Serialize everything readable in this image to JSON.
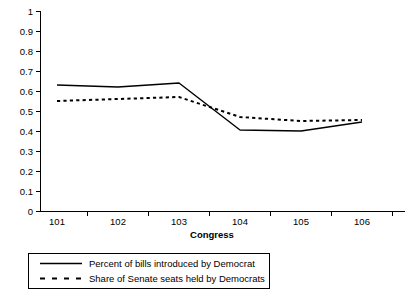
{
  "chart_data": {
    "type": "line",
    "title": "",
    "xlabel": "Congress",
    "ylabel": "",
    "categories": [
      "101",
      "102",
      "103",
      "104",
      "105",
      "106"
    ],
    "series": [
      {
        "name": "Percent of bills introduced by Democrat",
        "style": "solid",
        "values": [
          0.63,
          0.62,
          0.64,
          0.405,
          0.4,
          0.445
        ]
      },
      {
        "name": "Share of Senate seats held by Democrats",
        "style": "dashed",
        "values": [
          0.55,
          0.56,
          0.57,
          0.47,
          0.45,
          0.455
        ]
      }
    ],
    "ylim": [
      0,
      1
    ],
    "ytick_labels": [
      "0",
      "0.1",
      "0.2",
      "0.3",
      "0.4",
      "0.5",
      "0.6",
      "0.7",
      "0.8",
      "0.9",
      "1"
    ],
    "ytick_values": [
      0,
      0.1,
      0.2,
      0.3,
      0.4,
      0.5,
      0.6,
      0.7,
      0.8,
      0.9,
      1
    ],
    "grid": false,
    "legend_position": "bottom"
  },
  "axes": {
    "x_title": "Congress"
  },
  "legend": {
    "entries": [
      {
        "label": "Percent of bills introduced by Democrat",
        "style": "solid"
      },
      {
        "label": "Share of Senate seats held by Democrats",
        "style": "dashed"
      }
    ]
  }
}
